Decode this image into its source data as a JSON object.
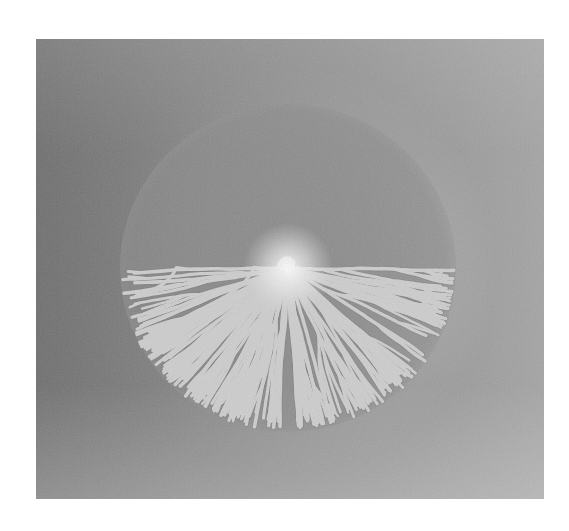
{
  "image": {
    "kind": "photograph",
    "subject": "radial branching colony pattern",
    "description": "Grayscale photograph of a circular, densely branched radial pattern of light fingers spreading from a bright center on a gray background"
  },
  "frame": {
    "left": 36,
    "top": 39,
    "width": 508,
    "height": 460
  },
  "colors": {
    "page_background": "#ffffff",
    "background_dark": "#6c6c6c",
    "background_light": "#b3b3b3",
    "finger_color": "#cdcdcd",
    "finger_edge": "#e2e2e2",
    "center_glow": "#f4f4f4",
    "gap_color": "#777777"
  },
  "colony": {
    "center_x": 252,
    "center_y": 229,
    "radius_x": 160,
    "radius_y": 156,
    "primary_branches": 64,
    "seed": 7
  }
}
